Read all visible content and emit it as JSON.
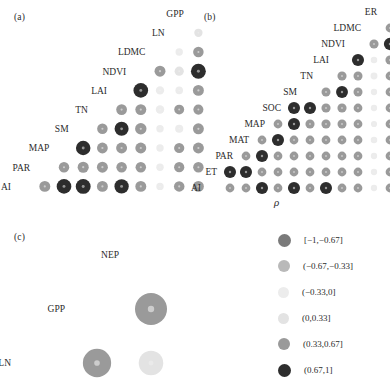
{
  "figure": {
    "background": "#ffffff",
    "rho_symbol": "ρ"
  },
  "panels": [
    {
      "id": "panel-a",
      "tag": "(a)",
      "tag_x": 14,
      "tag_y": 12,
      "origin_x": 16,
      "origin_y": 4,
      "cell": 19.2,
      "labels": [
        "GPP",
        "LN",
        "LDMC",
        "NDVI",
        "LAI",
        "TN",
        "SM",
        "MAP",
        "PAR",
        "AI"
      ]
    },
    {
      "id": "panel-b",
      "tag": "(b)",
      "tag_x": 204,
      "tag_y": 12,
      "origin_x": 206,
      "origin_y": 4,
      "cell": 16.0,
      "labels": [
        "ER",
        "LDMC",
        "NDVI",
        "LAI",
        "TN",
        "SM",
        "SOC",
        "MAP",
        "MAT",
        "PAR",
        "ET",
        "AI"
      ]
    },
    {
      "id": "panel-c",
      "tag": "(c)",
      "tag_x": 14,
      "tag_y": 232,
      "origin_x": 16,
      "origin_y": 228,
      "cell": 54.0,
      "labels": [
        "NEP",
        "GPP",
        "LN"
      ]
    }
  ],
  "legend": {
    "x": 278,
    "y": 232,
    "row_height": 26,
    "items": [
      {
        "label": "[−1,−0.67]",
        "color": "#7a7a7a",
        "size": 13
      },
      {
        "label": "(−0.67,−0.33]",
        "color": "#b9b9b9",
        "size": 12
      },
      {
        "label": "(−0.33,0]",
        "color": "#ececec",
        "size": 11
      },
      {
        "label": "(0,0.33]",
        "color": "#e3e3e3",
        "size": 11
      },
      {
        "label": "(0.33,0.67]",
        "color": "#9a9a9a",
        "size": 12
      },
      {
        "label": "(0.67,1]",
        "color": "#2d2d2d",
        "size": 13
      }
    ]
  },
  "chart_data": {
    "type": "heatmap",
    "title": "",
    "subtitle": "",
    "xlabel": "ρ",
    "ylabel": "",
    "grid": false,
    "legend_position": "right",
    "color_bins": [
      {
        "range": "[-1,-0.67]",
        "min": -1.0,
        "max": -0.67,
        "color": "#7a7a7a"
      },
      {
        "range": "(-0.67,-0.33]",
        "min": -0.67,
        "max": -0.33,
        "color": "#b9b9b9"
      },
      {
        "range": "(-0.33,0]",
        "min": -0.33,
        "max": 0.0,
        "color": "#ececec"
      },
      {
        "range": "(0,0.33]",
        "min": 0.0,
        "max": 0.33,
        "color": "#e3e3e3"
      },
      {
        "range": "(0.33,0.67]",
        "min": 0.33,
        "max": 0.67,
        "color": "#9a9a9a"
      },
      {
        "range": "(0.67,1]",
        "min": 0.67,
        "max": 1.0,
        "color": "#2d2d2d"
      }
    ],
    "panels": [
      {
        "panel": "a",
        "variables": [
          "GPP",
          "LN",
          "LDMC",
          "NDVI",
          "LAI",
          "TN",
          "SM",
          "MAP",
          "PAR",
          "AI"
        ],
        "cells": [
          {
            "row": "LN",
            "col": "GPP",
            "value": 0.2
          },
          {
            "row": "LDMC",
            "col": "GPP",
            "value": 0.45
          },
          {
            "row": "LDMC",
            "col": "LN",
            "value": -0.1
          },
          {
            "row": "NDVI",
            "col": "GPP",
            "value": 0.95
          },
          {
            "row": "NDVI",
            "col": "LN",
            "value": 0.3
          },
          {
            "row": "NDVI",
            "col": "LDMC",
            "value": 0.5
          },
          {
            "row": "LAI",
            "col": "GPP",
            "value": 0.5
          },
          {
            "row": "LAI",
            "col": "LN",
            "value": -0.12
          },
          {
            "row": "LAI",
            "col": "LDMC",
            "value": -0.2
          },
          {
            "row": "LAI",
            "col": "NDVI",
            "value": 0.92
          },
          {
            "row": "TN",
            "col": "GPP",
            "value": 0.4
          },
          {
            "row": "TN",
            "col": "LN",
            "value": 0.38
          },
          {
            "row": "TN",
            "col": "LDMC",
            "value": -0.22
          },
          {
            "row": "TN",
            "col": "NDVI",
            "value": 0.5
          },
          {
            "row": "TN",
            "col": "LAI",
            "value": 0.48
          },
          {
            "row": "SM",
            "col": "GPP",
            "value": 0.5
          },
          {
            "row": "SM",
            "col": "LN",
            "value": -0.18
          },
          {
            "row": "SM",
            "col": "LDMC",
            "value": -0.1
          },
          {
            "row": "SM",
            "col": "NDVI",
            "value": 0.55
          },
          {
            "row": "SM",
            "col": "LAI",
            "value": 0.85
          },
          {
            "row": "SM",
            "col": "TN",
            "value": 0.45
          },
          {
            "row": "MAP",
            "col": "GPP",
            "value": 0.5
          },
          {
            "row": "MAP",
            "col": "LN",
            "value": 0.42
          },
          {
            "row": "MAP",
            "col": "LDMC",
            "value": -0.1
          },
          {
            "row": "MAP",
            "col": "NDVI",
            "value": 0.5
          },
          {
            "row": "MAP",
            "col": "LAI",
            "value": 0.5
          },
          {
            "row": "MAP",
            "col": "TN",
            "value": 0.48
          },
          {
            "row": "MAP",
            "col": "SM",
            "value": 0.9
          },
          {
            "row": "PAR",
            "col": "GPP",
            "value": 0.45
          },
          {
            "row": "PAR",
            "col": "LN",
            "value": 0.42
          },
          {
            "row": "PAR",
            "col": "LDMC",
            "value": -0.1
          },
          {
            "row": "PAR",
            "col": "NDVI",
            "value": 0.45
          },
          {
            "row": "PAR",
            "col": "LAI",
            "value": 0.45
          },
          {
            "row": "PAR",
            "col": "TN",
            "value": 0.5
          },
          {
            "row": "PAR",
            "col": "SM",
            "value": 0.52
          },
          {
            "row": "PAR",
            "col": "MAP",
            "value": 0.45
          },
          {
            "row": "AI",
            "col": "GPP",
            "value": 0.5
          },
          {
            "row": "AI",
            "col": "LN",
            "value": 0.45
          },
          {
            "row": "AI",
            "col": "LDMC",
            "value": -0.1
          },
          {
            "row": "AI",
            "col": "NDVI",
            "value": 0.5
          },
          {
            "row": "AI",
            "col": "LAI",
            "value": 0.88
          },
          {
            "row": "AI",
            "col": "TN",
            "value": 0.5
          },
          {
            "row": "AI",
            "col": "SM",
            "value": 0.95
          },
          {
            "row": "AI",
            "col": "MAP",
            "value": 0.92
          },
          {
            "row": "AI",
            "col": "PAR",
            "value": 0.5
          }
        ]
      },
      {
        "panel": "b",
        "variables": [
          "ER",
          "LDMC",
          "NDVI",
          "LAI",
          "TN",
          "SM",
          "SOC",
          "MAP",
          "MAT",
          "PAR",
          "ET",
          "AI"
        ],
        "cells": [
          {
            "row": "LDMC",
            "col": "ER",
            "value": 0.45
          },
          {
            "row": "NDVI",
            "col": "ER",
            "value": 0.93
          },
          {
            "row": "NDVI",
            "col": "LDMC",
            "value": 0.5
          },
          {
            "row": "LAI",
            "col": "ER",
            "value": 0.5
          },
          {
            "row": "LAI",
            "col": "LDMC",
            "value": -0.15
          },
          {
            "row": "LAI",
            "col": "NDVI",
            "value": 0.9
          },
          {
            "row": "TN",
            "col": "ER",
            "value": 0.45
          },
          {
            "row": "TN",
            "col": "LDMC",
            "value": -0.2
          },
          {
            "row": "TN",
            "col": "NDVI",
            "value": 0.48
          },
          {
            "row": "TN",
            "col": "LAI",
            "value": 0.5
          },
          {
            "row": "SM",
            "col": "ER",
            "value": 0.45
          },
          {
            "row": "SM",
            "col": "LDMC",
            "value": -0.12
          },
          {
            "row": "SM",
            "col": "NDVI",
            "value": 0.48
          },
          {
            "row": "SM",
            "col": "LAI",
            "value": 0.88
          },
          {
            "row": "SM",
            "col": "TN",
            "value": 0.48
          },
          {
            "row": "SOC",
            "col": "ER",
            "value": 0.45
          },
          {
            "row": "SOC",
            "col": "LDMC",
            "value": -0.12
          },
          {
            "row": "SOC",
            "col": "NDVI",
            "value": 0.45
          },
          {
            "row": "SOC",
            "col": "LAI",
            "value": 0.5
          },
          {
            "row": "SOC",
            "col": "TN",
            "value": 0.5
          },
          {
            "row": "SOC",
            "col": "SM",
            "value": 0.9
          },
          {
            "row": "SOC",
            "col": "SOC",
            "value": 0.9
          },
          {
            "row": "MAP",
            "col": "ER",
            "value": 0.45
          },
          {
            "row": "MAP",
            "col": "LDMC",
            "value": -0.1
          },
          {
            "row": "MAP",
            "col": "NDVI",
            "value": 0.45
          },
          {
            "row": "MAP",
            "col": "LAI",
            "value": 0.48
          },
          {
            "row": "MAP",
            "col": "TN",
            "value": 0.5
          },
          {
            "row": "MAP",
            "col": "SM",
            "value": 0.5
          },
          {
            "row": "MAP",
            "col": "SOC",
            "value": 0.9
          },
          {
            "row": "MAP",
            "col": "MAP",
            "value": 0.45
          },
          {
            "row": "MAT",
            "col": "ER",
            "value": 0.45
          },
          {
            "row": "MAT",
            "col": "LDMC",
            "value": -0.15
          },
          {
            "row": "MAT",
            "col": "NDVI",
            "value": 0.45
          },
          {
            "row": "MAT",
            "col": "LAI",
            "value": 0.45
          },
          {
            "row": "MAT",
            "col": "TN",
            "value": 0.45
          },
          {
            "row": "MAT",
            "col": "SM",
            "value": 0.45
          },
          {
            "row": "MAT",
            "col": "SOC",
            "value": 0.45
          },
          {
            "row": "MAT",
            "col": "MAP",
            "value": 0.9
          },
          {
            "row": "MAT",
            "col": "MAT",
            "value": 0.45
          },
          {
            "row": "PAR",
            "col": "ER",
            "value": 0.45
          },
          {
            "row": "PAR",
            "col": "LDMC",
            "value": -0.12
          },
          {
            "row": "PAR",
            "col": "NDVI",
            "value": 0.45
          },
          {
            "row": "PAR",
            "col": "LAI",
            "value": 0.45
          },
          {
            "row": "PAR",
            "col": "TN",
            "value": 0.45
          },
          {
            "row": "PAR",
            "col": "SM",
            "value": 0.45
          },
          {
            "row": "PAR",
            "col": "SOC",
            "value": 0.45
          },
          {
            "row": "PAR",
            "col": "MAP",
            "value": 0.45
          },
          {
            "row": "PAR",
            "col": "MAT",
            "value": 0.9
          },
          {
            "row": "PAR",
            "col": "PAR",
            "value": 0.45
          },
          {
            "row": "ET",
            "col": "ER",
            "value": 0.45
          },
          {
            "row": "ET",
            "col": "LDMC",
            "value": -0.12
          },
          {
            "row": "ET",
            "col": "NDVI",
            "value": 0.45
          },
          {
            "row": "ET",
            "col": "LAI",
            "value": 0.45
          },
          {
            "row": "ET",
            "col": "TN",
            "value": 0.45
          },
          {
            "row": "ET",
            "col": "SM",
            "value": 0.45
          },
          {
            "row": "ET",
            "col": "SOC",
            "value": 0.45
          },
          {
            "row": "ET",
            "col": "MAP",
            "value": 0.45
          },
          {
            "row": "ET",
            "col": "MAT",
            "value": 0.45
          },
          {
            "row": "ET",
            "col": "PAR",
            "value": 0.9
          },
          {
            "row": "ET",
            "col": "ET",
            "value": 0.9
          },
          {
            "row": "AI",
            "col": "ER",
            "value": 0.45
          },
          {
            "row": "AI",
            "col": "LDMC",
            "value": -0.12
          },
          {
            "row": "AI",
            "col": "NDVI",
            "value": 0.45
          },
          {
            "row": "AI",
            "col": "LAI",
            "value": 0.45
          },
          {
            "row": "AI",
            "col": "TN",
            "value": 0.9
          },
          {
            "row": "AI",
            "col": "SM",
            "value": 0.45
          },
          {
            "row": "AI",
            "col": "SOC",
            "value": 0.9
          },
          {
            "row": "AI",
            "col": "MAP",
            "value": 0.45
          },
          {
            "row": "AI",
            "col": "MAT",
            "value": 0.9
          },
          {
            "row": "AI",
            "col": "PAR",
            "value": 0.45
          },
          {
            "row": "AI",
            "col": "ET",
            "value": 0.45
          }
        ]
      },
      {
        "panel": "c",
        "variables": [
          "NEP",
          "GPP",
          "LN"
        ],
        "cells": [
          {
            "row": "GPP",
            "col": "NEP",
            "value": 0.55
          },
          {
            "row": "LN",
            "col": "NEP",
            "value": 0.25
          },
          {
            "row": "LN",
            "col": "GPP",
            "value": 0.4
          }
        ]
      }
    ]
  }
}
